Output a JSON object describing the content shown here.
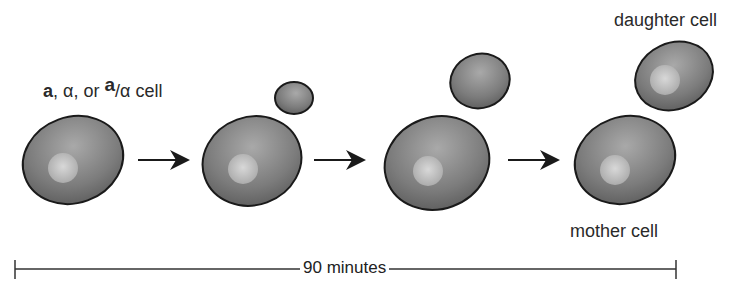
{
  "diagram": {
    "title_label": {
      "part1": "a",
      "part2": ", α, or ",
      "part3": "a",
      "part4": "/α",
      "part5": " cell"
    },
    "daughter_label": "daughter cell",
    "mother_label": "mother cell",
    "timescale_label": "90 minutes",
    "stages": [
      {
        "name": "unbudded cell"
      },
      {
        "name": "small bud"
      },
      {
        "name": "large bud"
      },
      {
        "name": "separated mother and daughter"
      }
    ],
    "colors": {
      "cell_fill": "#7a7a7a",
      "cell_highlight": "#a8a8a8",
      "nucleus": "#c8c8c8",
      "outline": "#1a1a1a"
    }
  }
}
